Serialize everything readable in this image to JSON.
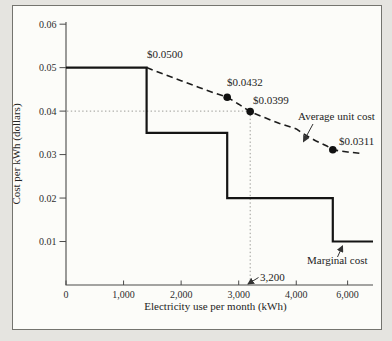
{
  "figure": {
    "background_outer": "#e5e4e0",
    "background_inner": "#fcfcf9",
    "border_color": "#74746f",
    "line_color": "#141414",
    "accent_color": "#111111"
  },
  "chart_data": {
    "type": "line",
    "title": "",
    "xlabel": "Electricity use per month (kWh)",
    "ylabel": "Cost per kWh (dollars)",
    "xlim": [
      0,
      6400
    ],
    "ylim": [
      0,
      0.0605
    ],
    "grid": "off",
    "legend": "inline-annotations",
    "x_scale_anchors": [
      [
        0,
        0
      ],
      [
        4000,
        0.75
      ],
      [
        5800,
        0.876
      ],
      [
        6400,
        1
      ]
    ],
    "x_ticks": [
      {
        "value": 0,
        "label": "0"
      },
      {
        "value": 1000,
        "label": "1,000"
      },
      {
        "value": 2000,
        "label": "2,000"
      },
      {
        "value": 3000,
        "label": "3,000"
      },
      {
        "value": 4000,
        "label": "4,000"
      },
      {
        "value": 6000,
        "label": "6,000"
      }
    ],
    "y_ticks": [
      {
        "value": 0.01,
        "label": "0.01"
      },
      {
        "value": 0.02,
        "label": "0.02"
      },
      {
        "value": 0.03,
        "label": "0.03"
      },
      {
        "value": 0.04,
        "label": "0.04"
      },
      {
        "value": 0.05,
        "label": "0.05"
      },
      {
        "value": 0.06,
        "label": "0.06"
      }
    ],
    "series": [
      {
        "name": "Marginal cost",
        "style": "step-solid",
        "points": [
          [
            0,
            0.05
          ],
          [
            1400,
            0.05
          ],
          [
            1400,
            0.035
          ],
          [
            2800,
            0.035
          ],
          [
            2800,
            0.02
          ],
          [
            5700,
            0.02
          ],
          [
            5700,
            0.01
          ],
          [
            6400,
            0.01
          ]
        ]
      },
      {
        "name": "Average unit cost",
        "style": "dashed-curve",
        "points": [
          [
            1400,
            0.05
          ],
          [
            1700,
            0.0485
          ],
          [
            2000,
            0.047
          ],
          [
            2300,
            0.0455
          ],
          [
            2550,
            0.0443
          ],
          [
            2800,
            0.0432
          ],
          [
            3000,
            0.0416
          ],
          [
            3200,
            0.0399
          ],
          [
            3450,
            0.0385
          ],
          [
            3700,
            0.0372
          ],
          [
            4000,
            0.0359
          ],
          [
            4300,
            0.0349
          ],
          [
            4600,
            0.034
          ],
          [
            4900,
            0.0332
          ],
          [
            5200,
            0.0325
          ],
          [
            5450,
            0.0319
          ],
          [
            5700,
            0.0311
          ],
          [
            6000,
            0.0306
          ],
          [
            6250,
            0.0302
          ]
        ]
      }
    ],
    "markers": [
      [
        2800,
        0.0432
      ],
      [
        3200,
        0.0399
      ],
      [
        5700,
        0.0311
      ]
    ],
    "reference_lines": {
      "x": 3200,
      "y": 0.04,
      "style": "dotted"
    },
    "annotations": [
      {
        "text": "$0.0500",
        "px": [
          147,
          58
        ]
      },
      {
        "text": "$0.0432",
        "px": [
          227,
          86
        ]
      },
      {
        "text": "$0.0399",
        "px": [
          253,
          104
        ]
      },
      {
        "text": "$0.0311",
        "px": [
          339,
          145
        ]
      },
      {
        "text": "Average unit cost",
        "px": [
          298,
          120
        ],
        "arrow_from": [
          313,
          124
        ],
        "arrow_to": [
          303.5,
          141.5
        ]
      },
      {
        "text": "Marginal cost",
        "px": [
          307,
          264
        ],
        "arrow_from": [
          337.5,
          257
        ],
        "arrow_to": [
          342.5,
          246
        ]
      },
      {
        "text": "3,200",
        "px": [
          260,
          281
        ],
        "arrow_from": [
          258.5,
          277.5
        ],
        "arrow_to": [
          248,
          284
        ]
      }
    ]
  }
}
